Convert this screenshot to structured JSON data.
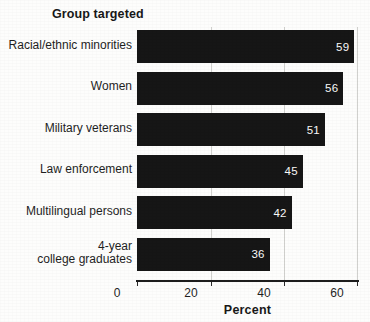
{
  "chart_data": {
    "type": "bar",
    "orientation": "horizontal",
    "title": "Group targeted",
    "xlabel": "Percent",
    "ylabel": "",
    "categories": [
      "Racial/ethnic minorities",
      "Women",
      "Military veterans",
      "Law enforcement",
      "Multilingual persons",
      "4-year\ncollege graduates"
    ],
    "values": [
      59,
      56,
      51,
      45,
      42,
      36
    ],
    "value_labels": [
      "59",
      "56",
      "51",
      "45",
      "42",
      "36"
    ],
    "xlim": [
      0,
      60
    ],
    "xticks": [
      0,
      20,
      40,
      60
    ],
    "xtick_labels": [
      "0",
      "20",
      "40",
      "60"
    ],
    "grid": "vertical-faint",
    "legend": "none",
    "bar_color": "#161616",
    "value_label_color": "#fafafa",
    "background_color": "#fdfdfc",
    "axis_color": "#1d1d1d"
  },
  "chart": {
    "group_title": "Group targeted",
    "x_axis_title": "Percent"
  }
}
